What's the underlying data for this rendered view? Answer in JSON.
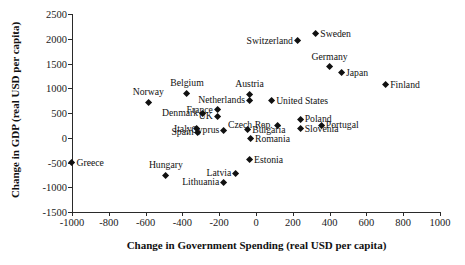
{
  "chart_data": {
    "type": "scatter",
    "title": "",
    "xlabel": "Change in Government Spending (real USD per capita)",
    "ylabel": "Change in GDP (real USD per capita)",
    "xlim": [
      -1000,
      1000
    ],
    "ylim": [
      -1500,
      2500
    ],
    "xticks": [
      -1000,
      -800,
      -600,
      -400,
      -200,
      0,
      200,
      400,
      600,
      800,
      1000
    ],
    "yticks": [
      -1500,
      -1000,
      -500,
      0,
      500,
      1000,
      1500,
      2000,
      2500
    ],
    "xtick_labels": [
      "-1000",
      "-800",
      "-600",
      "-400",
      "-200",
      "0",
      "200",
      "400",
      "600",
      "800",
      "1000"
    ],
    "ytick_labels": [
      "-1500",
      "-1000",
      "-500",
      "0",
      "500",
      "1000",
      "1500",
      "2000",
      "2500"
    ],
    "grid": false,
    "legend": false,
    "marker_color": "#111111",
    "marker_shape": "diamond",
    "points": [
      {
        "label": "Greece",
        "x": -1000,
        "y": -500,
        "pos": "right"
      },
      {
        "label": "Hungary",
        "x": -490,
        "y": -760,
        "pos": "above"
      },
      {
        "label": "Norway",
        "x": -585,
        "y": 720,
        "pos": "above"
      },
      {
        "label": "Belgium",
        "x": -375,
        "y": 900,
        "pos": "above"
      },
      {
        "label": "Denmark",
        "x": -290,
        "y": 490,
        "pos": "left"
      },
      {
        "label": "Italy",
        "x": -325,
        "y": 185,
        "pos": "left"
      },
      {
        "label": "Spain",
        "x": -315,
        "y": 110,
        "pos": "left"
      },
      {
        "label": "France",
        "x": -210,
        "y": 560,
        "pos": "left"
      },
      {
        "label": "UK",
        "x": -210,
        "y": 430,
        "pos": "left"
      },
      {
        "label": "Cyprus",
        "x": -175,
        "y": 150,
        "pos": "left"
      },
      {
        "label": "Lithuania",
        "x": -175,
        "y": -900,
        "pos": "left"
      },
      {
        "label": "Latvia",
        "x": -110,
        "y": -720,
        "pos": "left"
      },
      {
        "label": "Netherlands",
        "x": -35,
        "y": 760,
        "pos": "left"
      },
      {
        "label": "Austria",
        "x": -35,
        "y": 880,
        "pos": "above"
      },
      {
        "label": "Bulgaria",
        "x": -45,
        "y": 160,
        "pos": "right"
      },
      {
        "label": "Romania",
        "x": -30,
        "y": -20,
        "pos": "right"
      },
      {
        "label": "Estonia",
        "x": -35,
        "y": -440,
        "pos": "right"
      },
      {
        "label": "Czech Rep.",
        "x": 115,
        "y": 250,
        "pos": "left"
      },
      {
        "label": "United States",
        "x": 85,
        "y": 745,
        "pos": "right"
      },
      {
        "label": "Poland",
        "x": 240,
        "y": 370,
        "pos": "right"
      },
      {
        "label": "Slovenia",
        "x": 240,
        "y": 180,
        "pos": "right"
      },
      {
        "label": "Portugal",
        "x": 355,
        "y": 250,
        "pos": "right"
      },
      {
        "label": "Switzerland",
        "x": 225,
        "y": 1960,
        "pos": "left"
      },
      {
        "label": "Sweden",
        "x": 325,
        "y": 2100,
        "pos": "right"
      },
      {
        "label": "Germany",
        "x": 400,
        "y": 1430,
        "pos": "above"
      },
      {
        "label": "Japan",
        "x": 465,
        "y": 1310,
        "pos": "right"
      },
      {
        "label": "Finland",
        "x": 705,
        "y": 1065,
        "pos": "right"
      }
    ]
  }
}
